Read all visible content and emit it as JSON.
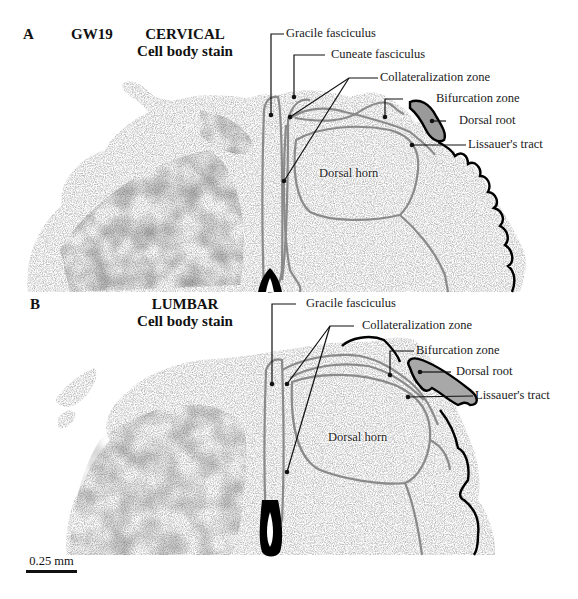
{
  "figure": {
    "panel_a": {
      "letter": "A",
      "age": "GW19",
      "level": "CERVICAL",
      "stain": "Cell body stain",
      "labels": {
        "gracile": "Gracile fasciculus",
        "cuneate": "Cuneate fasciculus",
        "collateralization": "Collateralization zone",
        "bifurcation": "Bifurcation zone",
        "dorsal_root": "Dorsal root",
        "lissauer": "Lissauer's tract",
        "dorsal_horn": "Dorsal horn"
      }
    },
    "panel_b": {
      "letter": "B",
      "level": "LUMBAR",
      "stain": "Cell body stain",
      "labels": {
        "gracile": "Gracile fasciculus",
        "collateralization": "Collateralization zone",
        "bifurcation": "Bifurcation zone",
        "dorsal_root": "Dorsal root",
        "lissauer": "Lissauer's tract",
        "dorsal_horn": "Dorsal horn"
      }
    },
    "scale_bar": {
      "label": "0.25 mm"
    },
    "colors": {
      "tissue": "#c9c9c9",
      "tissue_dark": "#6f6f6f",
      "outline_gray": "#8a8a8a",
      "outline_black": "#000000",
      "leader_line": "#111111"
    }
  }
}
